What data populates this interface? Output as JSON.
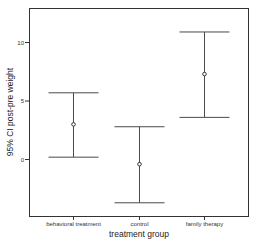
{
  "chart_data": {
    "type": "errorbar",
    "title": "",
    "xlabel": "treatment group",
    "ylabel": "95% CI post-pre weight",
    "categories": [
      "behavioral treatment",
      "control",
      "family therapy"
    ],
    "series": [
      {
        "name": "95% CI post-pre weight",
        "mean": [
          3.0,
          -0.4,
          7.3
        ],
        "lower": [
          0.2,
          -3.7,
          3.6
        ],
        "upper": [
          5.7,
          2.8,
          10.9
        ]
      }
    ],
    "yticks": [
      0,
      5,
      10
    ],
    "ytick_labels": [
      "0",
      "5",
      "10"
    ],
    "ylim": [
      -4.9,
      12.9
    ],
    "grid": false,
    "legend": null
  }
}
